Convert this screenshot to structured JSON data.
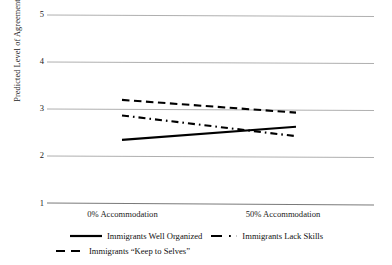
{
  "chart_data": {
    "type": "line",
    "title": "",
    "subtitle": "",
    "xlabel": "",
    "ylabel": "Predicted Level of Agreement",
    "categories": [
      "0% Accommodation",
      "50% Accommodation"
    ],
    "x": [
      0,
      1
    ],
    "ylim": [
      1,
      5
    ],
    "yticks": [
      1,
      2,
      3,
      4,
      5
    ],
    "ytick_labels": [
      "1",
      "2",
      "3",
      "4",
      "5"
    ],
    "grid": "horizontal",
    "legend_position": "bottom",
    "series": [
      {
        "name": "Immigrants Well Organized",
        "style": "solid",
        "color": "#000000",
        "values": [
          2.35,
          2.63
        ]
      },
      {
        "name": "Immigrants Lack Skills",
        "style": "dash-dot",
        "color": "#000000",
        "values": [
          2.87,
          2.43
        ]
      },
      {
        "name": "Immigrants “Keep to Selves”",
        "style": "dashed",
        "color": "#000000",
        "values": [
          3.2,
          2.93
        ]
      }
    ]
  },
  "axis": {
    "y_label": "Predicted Level of Agreement",
    "y_ticks": [
      "5",
      "4",
      "3",
      "2",
      "1"
    ],
    "x_ticks": [
      "0% Accommodation",
      "50% Accommodation"
    ]
  },
  "legend": {
    "items": [
      {
        "label": "Immigrants Well Organized",
        "style": "solid"
      },
      {
        "label": "Immigrants Lack Skills",
        "style": "dash-dot"
      },
      {
        "label": "Immigrants “Keep to Selves”",
        "style": "dashed"
      }
    ]
  },
  "colors": {
    "line": "#000000",
    "grid": "#a6a6a6",
    "text": "#1a1a1a",
    "background": "#ffffff"
  }
}
